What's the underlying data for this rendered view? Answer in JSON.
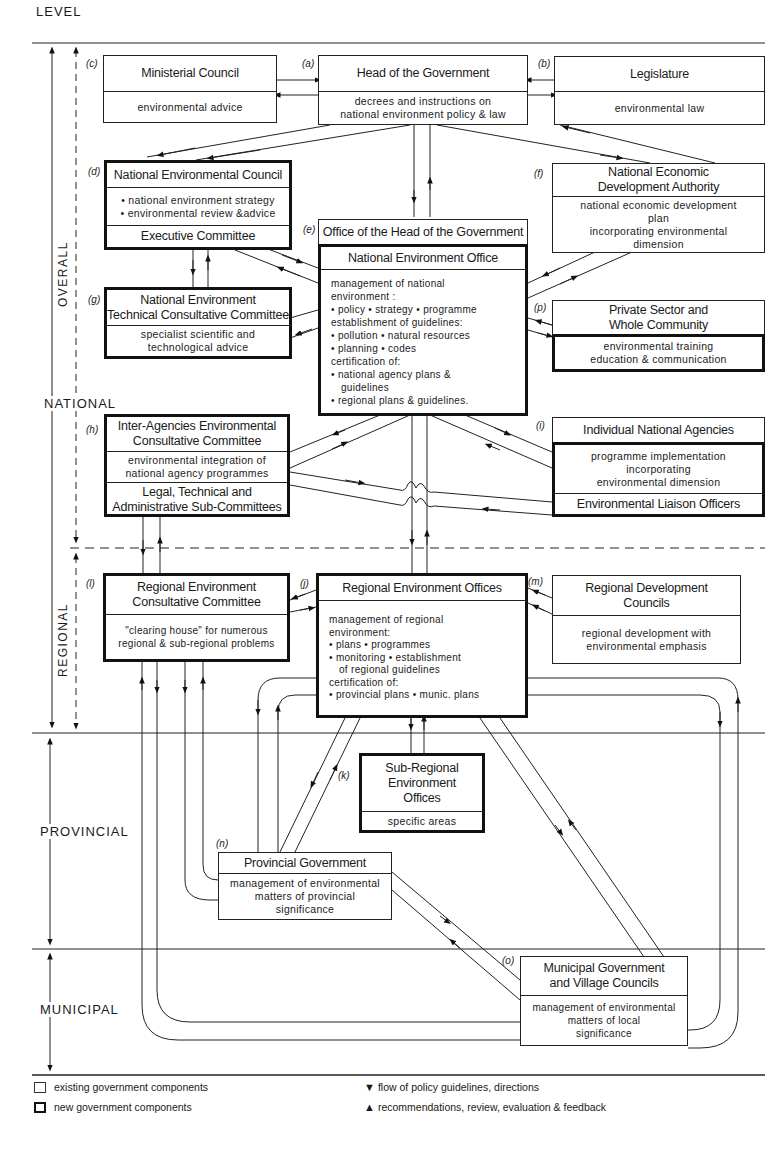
{
  "diagram": {
    "level_header": "LEVEL",
    "levels": {
      "overall": "OVERALL",
      "national": "NATIONAL",
      "regional": "REGIONAL",
      "provincial": "PROVINCIAL",
      "municipal": "MUNICIPAL"
    },
    "nodes": {
      "c": {
        "tag": "(c)",
        "title": "Ministerial Council",
        "body": [
          "environmental advice"
        ],
        "type": "existing"
      },
      "a": {
        "tag": "(a)",
        "title": "Head of the Government",
        "body": [
          "decrees and instructions on",
          "national environment policy & law"
        ],
        "type": "existing"
      },
      "b": {
        "tag": "(b)",
        "title": "Legislature",
        "body": [
          "environmental law"
        ],
        "type": "existing"
      },
      "d": {
        "tag": "(d)",
        "title": "National Environmental Council",
        "body": [
          "• national environment strategy",
          "• environmental review &advice"
        ],
        "footer": "Executive Committee",
        "type": "new"
      },
      "f": {
        "tag": "(f)",
        "title": [
          "National Economic",
          "Development Authority"
        ],
        "body": [
          "national economic development",
          "plan",
          "incorporating environmental",
          "dimension"
        ],
        "type": "existing"
      },
      "e": {
        "tag": "(e)",
        "header": "Office of the Head of the Government",
        "title": "National Environment Office",
        "body": [
          "management of national",
          "environment :",
          "• policy  • strategy  • programme",
          "establishment of guidelines:",
          "• pollution  • natural resources",
          "• planning  • codes",
          "certification of:",
          "• national agency plans &",
          "  guidelines",
          "• regional plans & guidelines."
        ],
        "type": "new"
      },
      "g": {
        "tag": "(g)",
        "title": [
          "National Environment",
          "Technical Consultative Committee"
        ],
        "body": [
          "specialist scientific and",
          "technological advice"
        ],
        "type": "new"
      },
      "p": {
        "tag": "(p)",
        "title": [
          "Private Sector and",
          "Whole Community"
        ],
        "body": [
          "environmental training",
          "education & communication"
        ],
        "type": "mixed"
      },
      "h": {
        "tag": "(h)",
        "title": [
          "Inter-Agencies Environmental",
          "Consultative Committee"
        ],
        "body": [
          "environmental integration of",
          "national agency programmes"
        ],
        "footer": [
          "Legal, Technical and",
          "Administrative Sub-Committees"
        ],
        "type": "new"
      },
      "i": {
        "tag": "(i)",
        "title": "Individual National Agencies",
        "body": [
          "programme implementation",
          "incorporating",
          "environmental dimension"
        ],
        "footer": "Environmental Liaison Officers",
        "type": "mixed"
      },
      "l": {
        "tag": "(l)",
        "title": [
          "Regional Environment",
          "Consultative Committee"
        ],
        "body": [
          "\"clearing house\" for numerous",
          "regional & sub-regional problems"
        ],
        "type": "new"
      },
      "j": {
        "tag": "(j)",
        "title": "Regional Environment Offices",
        "body": [
          "management of regional",
          "environment:",
          "• plans  • programmes",
          "• monitoring  • establishment",
          "  of regional guidelines",
          "certification of:",
          "• provincial plans • munic. plans"
        ],
        "type": "new"
      },
      "m": {
        "tag": "(m)",
        "title": [
          "Regional Development",
          "Councils"
        ],
        "body": [
          "regional development with",
          "environmental emphasis"
        ],
        "type": "existing"
      },
      "k": {
        "tag": "(k)",
        "title": [
          "Sub-Regional",
          "Environment",
          "Offices"
        ],
        "body": [
          "specific areas"
        ],
        "type": "new"
      },
      "n": {
        "tag": "(n)",
        "title": "Provincial Government",
        "body": [
          "management of environmental",
          "matters of provincial",
          "significance"
        ],
        "type": "existing"
      },
      "o": {
        "tag": "(o)",
        "title": [
          "Municipal Government",
          "and Village Councils"
        ],
        "body": [
          "management of environmental",
          "matters of local",
          "significance"
        ],
        "type": "existing"
      }
    },
    "legend": {
      "existing": "existing government components",
      "new": "new government components",
      "down_arrow": "flow of policy guidelines, directions",
      "up_arrow": "recommendations, review, evaluation & feedback",
      "down_glyph": "▼",
      "up_glyph": "▲"
    }
  }
}
